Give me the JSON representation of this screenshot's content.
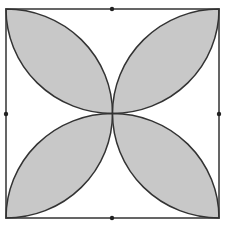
{
  "diagram": {
    "colors": {
      "background": "#ffffff",
      "stroke": "#333333",
      "fill": "#c8c8c8"
    },
    "square": {
      "x0": 6,
      "y0": 9,
      "x1": 219,
      "y1": 218
    },
    "midpoint_dots": [
      {
        "name": "top",
        "x": 112,
        "y": 9
      },
      {
        "name": "left",
        "x": 6,
        "y": 114
      },
      {
        "name": "right",
        "x": 219,
        "y": 114
      },
      {
        "name": "bottom",
        "x": 112,
        "y": 218
      }
    ],
    "petals": [
      {
        "name": "top-left",
        "corner": "top-left"
      },
      {
        "name": "top-right",
        "corner": "top-right"
      },
      {
        "name": "bottom-left",
        "corner": "bottom-left"
      },
      {
        "name": "bottom-right",
        "corner": "bottom-right"
      }
    ]
  }
}
